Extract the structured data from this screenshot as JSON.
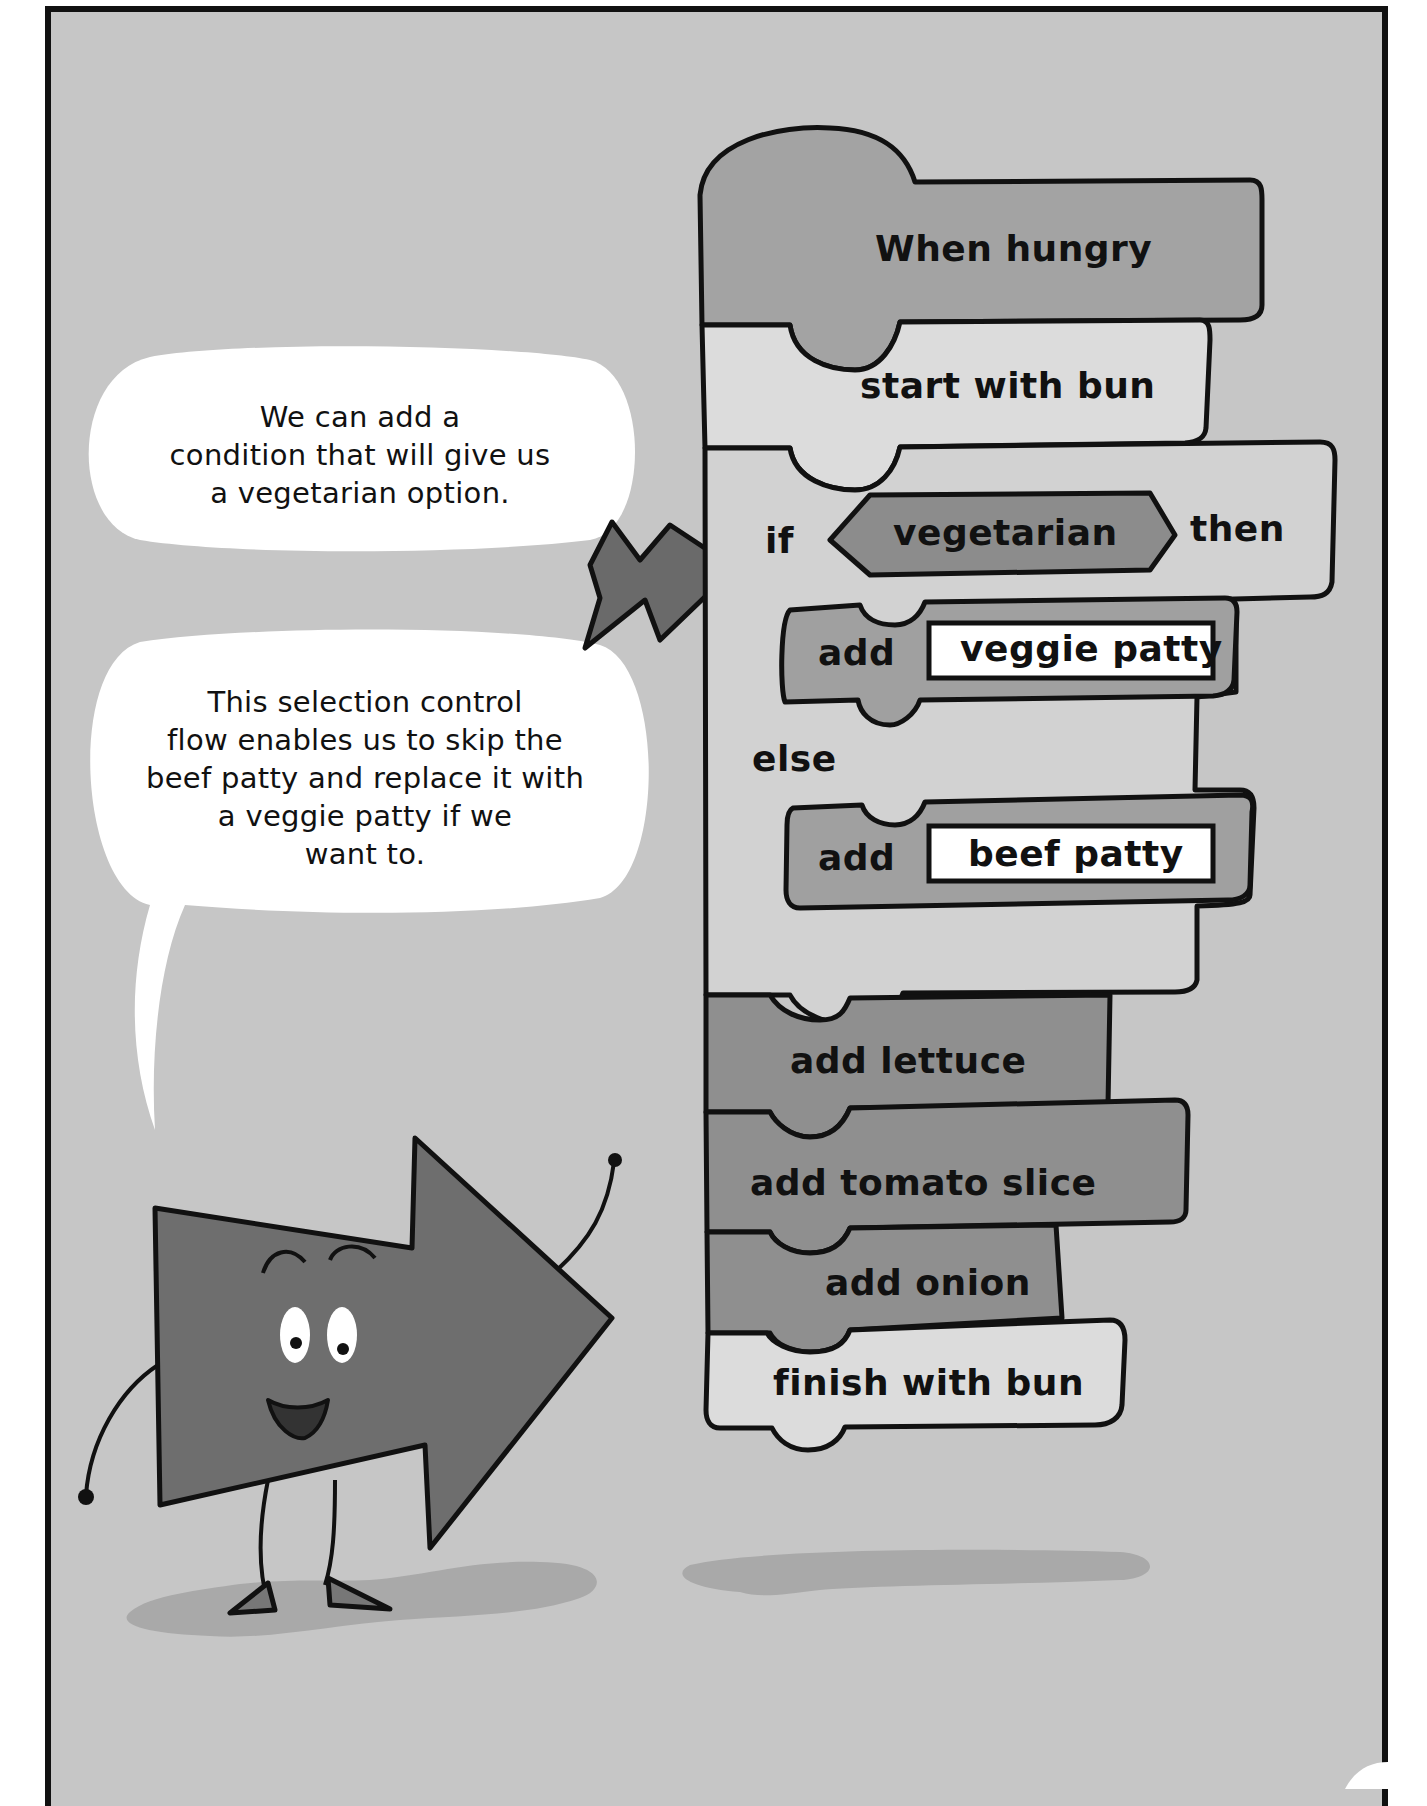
{
  "page": {
    "page_number_partial": "1?"
  },
  "speech_bubbles": [
    {
      "id": "bubble-1",
      "lines": [
        "We can add a",
        "condition that will give us",
        "a vegetarian option."
      ]
    },
    {
      "id": "bubble-2",
      "lines": [
        "This selection control",
        "flow enables us to skip the",
        "beef patty and replace it with",
        "a veggie patty if we",
        "want to."
      ]
    }
  ],
  "code_blocks": {
    "hat": {
      "label": "When hungry",
      "color": "#a3a3a3"
    },
    "start": {
      "label": "start with bun",
      "color": "#dcdcdc"
    },
    "if_else": {
      "if_keyword": "if",
      "condition": "vegetarian",
      "then_keyword": "then",
      "else_keyword": "else",
      "color": "#d2d2d2",
      "condition_color": "#8c8c8c",
      "then_branch": {
        "verb": "add",
        "value": "veggie patty",
        "color": "#a0a0a0"
      },
      "else_branch": {
        "verb": "add",
        "value": "beef patty",
        "color": "#a0a0a0"
      }
    },
    "steps": [
      {
        "label": "add lettuce",
        "color": "#8f8f8f"
      },
      {
        "label": "add tomato slice",
        "color": "#8f8f8f"
      },
      {
        "label": "add onion",
        "color": "#8f8f8f"
      },
      {
        "label": "finish with bun",
        "color": "#dcdcdc"
      }
    ]
  },
  "colors": {
    "background": "#c6c6c6",
    "outline": "#111111",
    "character": "#6e6e6e",
    "pointer_arrow": "#6a6a6a",
    "bubble": "#ffffff",
    "shadow": "#a9a9a9"
  }
}
